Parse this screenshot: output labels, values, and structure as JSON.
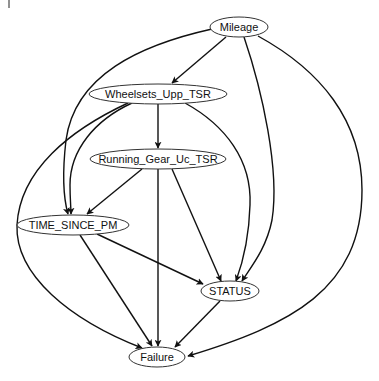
{
  "diagram": {
    "type": "directed-acyclic-graph",
    "nodes": [
      {
        "id": "mileage",
        "label": "Mileage",
        "cx": 239,
        "cy": 27,
        "rx": 29,
        "ry": 10
      },
      {
        "id": "wheelsets",
        "label": "Wheelsets_Upp_TSR",
        "cx": 158,
        "cy": 94,
        "rx": 69,
        "ry": 10
      },
      {
        "id": "running_gear",
        "label": "Running_Gear_Uc_TSR",
        "cx": 158,
        "cy": 159,
        "rx": 68,
        "ry": 10
      },
      {
        "id": "time_since_pm",
        "label": "TIME_SINCE_PM",
        "cx": 73,
        "cy": 225,
        "rx": 56,
        "ry": 10
      },
      {
        "id": "status",
        "label": "STATUS",
        "cx": 230,
        "cy": 291,
        "rx": 29,
        "ry": 10
      },
      {
        "id": "failure",
        "label": "Failure",
        "cx": 157,
        "cy": 357,
        "rx": 28,
        "ry": 10
      }
    ],
    "edges": [
      {
        "from": "Mileage",
        "to": "Wheelsets_Upp_TSR"
      },
      {
        "from": "Mileage",
        "to": "TIME_SINCE_PM"
      },
      {
        "from": "Mileage",
        "to": "STATUS"
      },
      {
        "from": "Mileage",
        "to": "Failure"
      },
      {
        "from": "Wheelsets_Upp_TSR",
        "to": "Running_Gear_Uc_TSR"
      },
      {
        "from": "Wheelsets_Upp_TSR",
        "to": "TIME_SINCE_PM"
      },
      {
        "from": "Wheelsets_Upp_TSR",
        "to": "STATUS"
      },
      {
        "from": "Wheelsets_Upp_TSR",
        "to": "Failure"
      },
      {
        "from": "Running_Gear_Uc_TSR",
        "to": "TIME_SINCE_PM"
      },
      {
        "from": "Running_Gear_Uc_TSR",
        "to": "STATUS"
      },
      {
        "from": "Running_Gear_Uc_TSR",
        "to": "Failure"
      },
      {
        "from": "TIME_SINCE_PM",
        "to": "STATUS"
      },
      {
        "from": "TIME_SINCE_PM",
        "to": "Failure"
      },
      {
        "from": "STATUS",
        "to": "Failure"
      }
    ]
  },
  "colors": {
    "edge": "#111111",
    "node_stroke": "#333333",
    "node_fill": "#ffffff",
    "background": "#ffffff"
  }
}
